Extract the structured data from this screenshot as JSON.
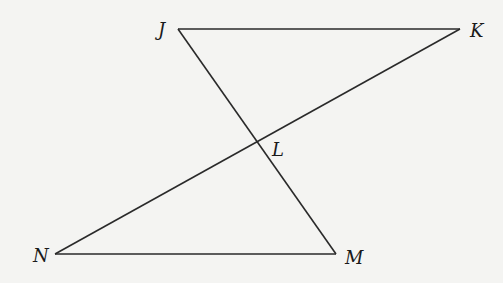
{
  "diagram": {
    "type": "geometry",
    "points": {
      "J": {
        "label": "J",
        "x": 178,
        "y": 29
      },
      "K": {
        "label": "K",
        "x": 460,
        "y": 29
      },
      "L": {
        "label": "L",
        "x": 257,
        "y": 141
      },
      "N": {
        "label": "N",
        "x": 55,
        "y": 254
      },
      "M": {
        "label": "M",
        "x": 336,
        "y": 254
      }
    },
    "segments": [
      "JK",
      "JM",
      "KN",
      "NM"
    ],
    "colors": {
      "line": "#2a2a2a",
      "background": "#f4f4f2"
    }
  }
}
